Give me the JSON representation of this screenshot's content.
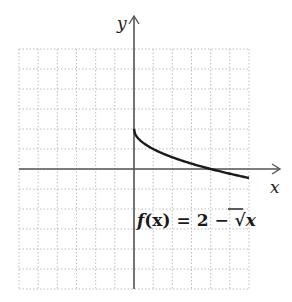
{
  "chart_data": {
    "type": "line",
    "title": "",
    "xlabel": "x",
    "ylabel": "y",
    "xlim": [
      -6,
      6
    ],
    "ylim": [
      -6,
      6
    ],
    "grid": true,
    "grid_style": "dotted",
    "annotation": "f(x) = 2 − √x",
    "series": [
      {
        "name": "f(x) = 2 - sqrt(x)",
        "x": [
          0,
          0.25,
          0.5,
          1,
          1.5,
          2,
          2.5,
          3,
          3.5,
          4,
          4.5,
          5,
          5.5,
          6
        ],
        "y": [
          2,
          1.5,
          1.29,
          1,
          0.78,
          0.59,
          0.42,
          0.27,
          0.13,
          0,
          -0.12,
          -0.24,
          -0.35,
          -0.45
        ]
      }
    ]
  },
  "labels": {
    "x_axis": "x",
    "y_axis": "y",
    "function_prefix": "f",
    "function_arg": "(x)",
    "function_rest": " = 2 − √",
    "function_radicand": "x"
  },
  "colors": {
    "axis": "#555555",
    "curve": "#1a1a1a",
    "grid": "#bdbdbd"
  }
}
